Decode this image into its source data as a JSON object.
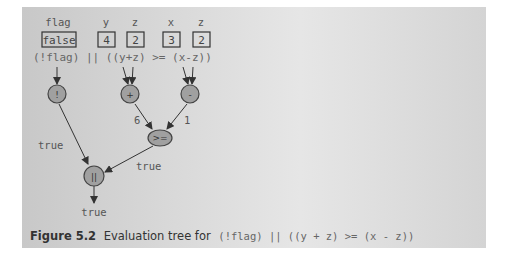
{
  "variables": [
    {
      "name": "flag",
      "value": "false"
    },
    {
      "name": "y",
      "value": "4"
    },
    {
      "name": "z",
      "value": "2"
    },
    {
      "name": "x",
      "value": "3"
    },
    {
      "name": "z",
      "value": "2"
    }
  ],
  "expression": "(!flag) || ((y+z) >= (x-z))",
  "nodes": [
    {
      "id": "not",
      "symbol": "!"
    },
    {
      "id": "plus",
      "symbol": "+"
    },
    {
      "id": "minus",
      "symbol": "-"
    },
    {
      "id": "gte",
      "symbol": ">="
    },
    {
      "id": "or",
      "symbol": "||"
    }
  ],
  "edge_labels": {
    "not_to_or": "true",
    "plus_to_gte": "6",
    "minus_to_gte": "1",
    "gte_to_or": "true",
    "result": "true"
  },
  "caption": {
    "figure": "Figure 5.2",
    "text": "Evaluation tree for",
    "code": "(!flag) || ((y + z) >= (x - z))"
  },
  "colors": {
    "node_fill": "#a0a0a0",
    "node_stroke": "#444444",
    "edge": "#333333"
  }
}
